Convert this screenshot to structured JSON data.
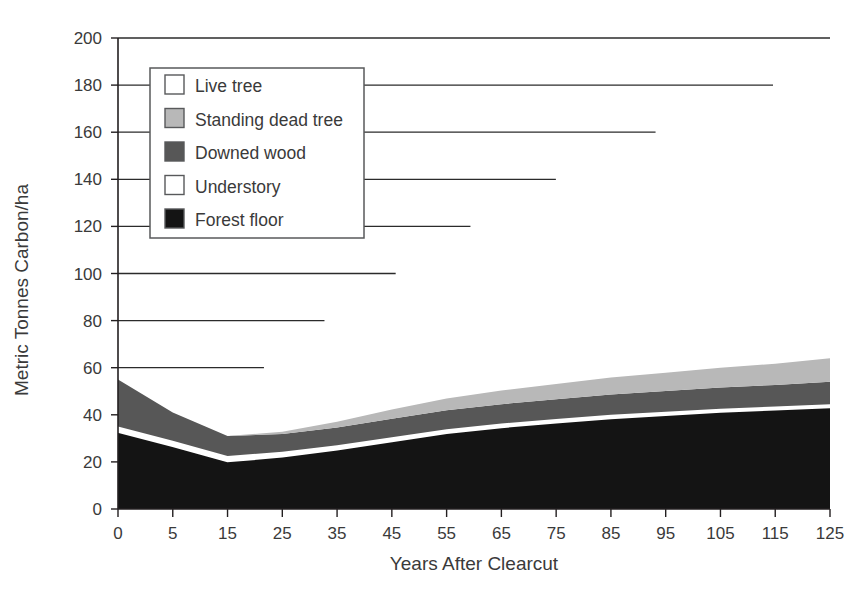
{
  "chart_data": {
    "type": "area",
    "stacked": true,
    "title": "",
    "xlabel": "Years After Clearcut",
    "ylabel": "Metric Tonnes Carbon/ha",
    "x": [
      0,
      5,
      15,
      25,
      35,
      45,
      55,
      65,
      75,
      85,
      95,
      105,
      115,
      125
    ],
    "xtick_labels": [
      "0",
      "5",
      "15",
      "25",
      "35",
      "45",
      "55",
      "65",
      "75",
      "85",
      "95",
      "105",
      "115",
      "125"
    ],
    "ytick_labels": [
      "0",
      "20",
      "40",
      "60",
      "80",
      "100",
      "120",
      "140",
      "160",
      "180",
      "200"
    ],
    "ytick_values": [
      0,
      20,
      40,
      60,
      80,
      100,
      120,
      140,
      160,
      180,
      200
    ],
    "xlim": [
      0,
      125
    ],
    "ylim": [
      0,
      200
    ],
    "grid": "horizontal-partial",
    "legend_position": "upper-left-inset",
    "series": [
      {
        "name": "Forest floor",
        "color": "#141414",
        "values": [
          33.0,
          27.0,
          20.5,
          22.5,
          25.5,
          29.0,
          32.5,
          35.0,
          37.0,
          38.8,
          40.2,
          41.5,
          42.5,
          43.5
        ]
      },
      {
        "name": "Understory",
        "color": "#ffffff",
        "values": [
          2.0,
          2.0,
          2.0,
          1.8,
          1.6,
          1.5,
          1.4,
          1.3,
          1.2,
          1.2,
          1.1,
          1.1,
          1.0,
          1.0
        ]
      },
      {
        "name": "Downed wood",
        "color": "#575757",
        "values": [
          20.0,
          12.0,
          8.5,
          7.5,
          7.5,
          7.8,
          8.0,
          8.2,
          8.4,
          8.6,
          8.8,
          9.0,
          9.2,
          9.5
        ]
      },
      {
        "name": "Standing dead tree",
        "color": "#b8b8b8",
        "values": [
          0.0,
          0.0,
          0.0,
          1.0,
          2.5,
          4.0,
          5.0,
          5.8,
          6.5,
          7.2,
          7.8,
          8.4,
          9.0,
          10.0
        ]
      },
      {
        "name": "Live tree",
        "color": "#ffffff",
        "values": [
          0.0,
          0.0,
          0.0,
          0.0,
          0.0,
          0.0,
          0.0,
          0.0,
          0.0,
          0.0,
          0.0,
          0.0,
          0.0,
          0.0
        ]
      }
    ],
    "gridline_extent_fraction": {
      "200": 1.0,
      "180": 0.92,
      "160": 0.755,
      "140": 0.615,
      "120": 0.495,
      "100": 0.39,
      "80": 0.29,
      "60": 0.205
    },
    "legend_order": [
      "Live tree",
      "Standing dead tree",
      "Downed wood",
      "Understory",
      "Forest floor"
    ]
  },
  "legend": {
    "items": [
      {
        "label": "Live tree",
        "swatch": "#ffffff"
      },
      {
        "label": "Standing dead tree",
        "swatch": "#b8b8b8"
      },
      {
        "label": "Downed wood",
        "swatch": "#575757"
      },
      {
        "label": "Understory",
        "swatch": "#ffffff"
      },
      {
        "label": "Forest floor",
        "swatch": "#141414"
      }
    ]
  },
  "axes": {
    "x_title": "Years After Clearcut",
    "y_title": "Metric Tonnes Carbon/ha"
  }
}
